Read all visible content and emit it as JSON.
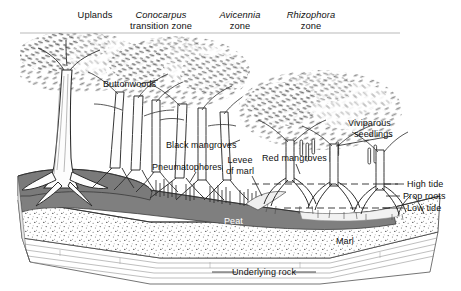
{
  "figure": {
    "type": "block-diagram",
    "style": "pen-and-ink grayscale cross-section"
  },
  "zone_headers": [
    {
      "name": "uplands",
      "label": "Uplands",
      "italic": "",
      "line2": ""
    },
    {
      "name": "conocarpus",
      "label": "",
      "italic": "Conocarpus",
      "line2": "transition zone"
    },
    {
      "name": "avicennia",
      "label": "",
      "italic": "Avicennia",
      "line2": "zone"
    },
    {
      "name": "rhizophora",
      "label": "",
      "italic": "Rhizophora",
      "line2": "zone"
    }
  ],
  "feature_labels": {
    "buttonwoods": "Buttonwoods",
    "black_mangroves": "Black mangroves",
    "pneumatophores": "Pneumatophores",
    "levee_line1": "Levee",
    "levee_line2": "of marl",
    "red_mangroves": "Red mangroves",
    "viviparous_line1": "Viviparous",
    "viviparous_line2": "seedlings",
    "high_tide": "High tide",
    "prop_roots": "Prop roots",
    "low_tide": "Low tide",
    "peat": "Peat",
    "marl": "Marl",
    "underlying_rock": "Underlying rock"
  },
  "strata": [
    {
      "name": "peat",
      "label": "Peat",
      "fill": "#7f7f7f",
      "text_color": "#ffffff"
    },
    {
      "name": "marl",
      "label": "Marl",
      "fill": "#ffffff",
      "text_color": "#111111"
    },
    {
      "name": "underlying-rock",
      "label": "Underlying rock",
      "fill": "#ffffff",
      "text_color": "#111111"
    }
  ],
  "colors": {
    "background": "#ffffff",
    "ink": "#111111",
    "peat_gray": "#7f7f7f",
    "canopy_dark": "#6e6e6e",
    "canopy_mid": "#9a9a9a",
    "canopy_light": "#c4c4c4",
    "stipple": "#555555"
  }
}
